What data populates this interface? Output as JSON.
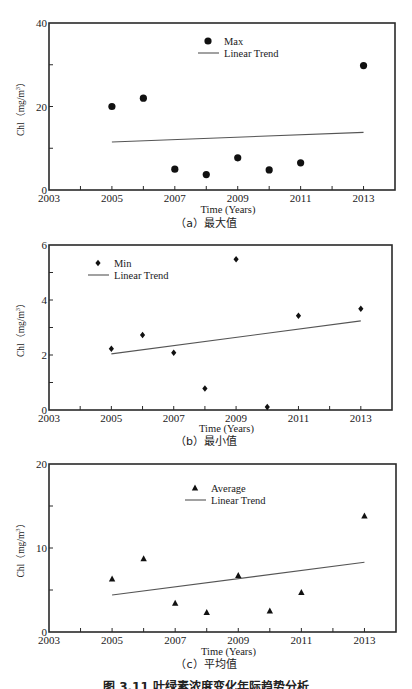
{
  "chart_data": [
    {
      "type": "scatter",
      "panel_label": "(a) 最大值",
      "xlabel": "Time (Years)",
      "ylabel": "Chl（mg/m³）",
      "xlim": [
        2003,
        2014
      ],
      "ylim": [
        0,
        40
      ],
      "xticks": [
        "2003",
        "2005",
        "2007",
        "2009",
        "2011",
        "2013"
      ],
      "yticks": [
        "0",
        "20",
        "40"
      ],
      "grid": false,
      "legend": {
        "position": "upper-center",
        "entries": [
          "Max",
          "Linear Trend"
        ]
      },
      "marker": "circle",
      "series": [
        {
          "name": "Max",
          "x": [
            2005,
            2006,
            2007,
            2008,
            2009,
            2010,
            2011,
            2013
          ],
          "values": [
            20.0,
            22.0,
            5.0,
            3.7,
            7.7,
            4.8,
            6.5,
            29.8
          ]
        },
        {
          "name": "Linear Trend",
          "x": [
            2005,
            2013
          ],
          "values": [
            11.5,
            13.8
          ]
        }
      ]
    },
    {
      "type": "scatter",
      "panel_label": "(b) 最小值",
      "xlabel": "Time (Years)",
      "ylabel": "Chl（mg/m³）",
      "xlim": [
        2003,
        2014
      ],
      "ylim": [
        0,
        6
      ],
      "xticks": [
        "2003",
        "2005",
        "2007",
        "2009",
        "2011",
        "2013"
      ],
      "yticks": [
        "0",
        "2",
        "4",
        "6"
      ],
      "grid": false,
      "legend": {
        "position": "upper-left",
        "entries": [
          "Min",
          "Linear Trend"
        ]
      },
      "marker": "diamond",
      "series": [
        {
          "name": "Min",
          "x": [
            2005,
            2006,
            2007,
            2008,
            2009,
            2010,
            2011,
            2013
          ],
          "values": [
            2.23,
            2.73,
            2.08,
            0.78,
            5.48,
            0.11,
            3.43,
            3.68
          ]
        },
        {
          "name": "Linear Trend",
          "x": [
            2005,
            2013
          ],
          "values": [
            2.04,
            3.24
          ]
        }
      ]
    },
    {
      "type": "scatter",
      "panel_label": "(c) 平均值",
      "xlabel": "Time (Years)",
      "ylabel": "Chl（mg/m³）",
      "xlim": [
        2003,
        2014
      ],
      "ylim": [
        0,
        20
      ],
      "xticks": [
        "2003",
        "2005",
        "2007",
        "2009",
        "2011",
        "2013"
      ],
      "yticks": [
        "0",
        "10",
        "20"
      ],
      "grid": false,
      "legend": {
        "position": "upper-center",
        "entries": [
          "Average",
          "Linear Trend"
        ]
      },
      "marker": "triangle",
      "series": [
        {
          "name": "Average",
          "x": [
            2005,
            2006,
            2007,
            2008,
            2009,
            2010,
            2011,
            2013
          ],
          "values": [
            6.3,
            8.7,
            3.4,
            2.3,
            6.7,
            2.5,
            4.7,
            13.8
          ]
        },
        {
          "name": "Linear Trend",
          "x": [
            2005,
            2013
          ],
          "values": [
            4.4,
            8.3
          ]
        }
      ]
    }
  ],
  "panels": [
    {
      "ylabel_main": "Chl",
      "ylabel_unit": "（mg/m",
      "ylabel_sup": "3",
      "ylabel_close": "）",
      "xlabel": "Time (Years)",
      "caption": "（a）最大值",
      "legend_series": "Max",
      "legend_trend": "Linear Trend"
    },
    {
      "ylabel_main": "Chl",
      "ylabel_unit": "（mg/m",
      "ylabel_sup": "3",
      "ylabel_close": "）",
      "xlabel": "Time (Years)",
      "caption": "（b）最小值",
      "legend_series": "Min",
      "legend_trend": "Linear Trend"
    },
    {
      "ylabel_main": "Chl",
      "ylabel_unit": "（mg/m",
      "ylabel_sup": "3",
      "ylabel_close": "）",
      "xlabel": "Time (Years)",
      "caption": "（c）平均值",
      "legend_series": "Average",
      "legend_trend": "Linear Trend"
    }
  ],
  "figure_caption": "图 3.11  叶绿素浓度变化年际趋势分析",
  "colors": {
    "axis": "#2a2a2a",
    "marker": "#111111",
    "trend": "#555555"
  }
}
